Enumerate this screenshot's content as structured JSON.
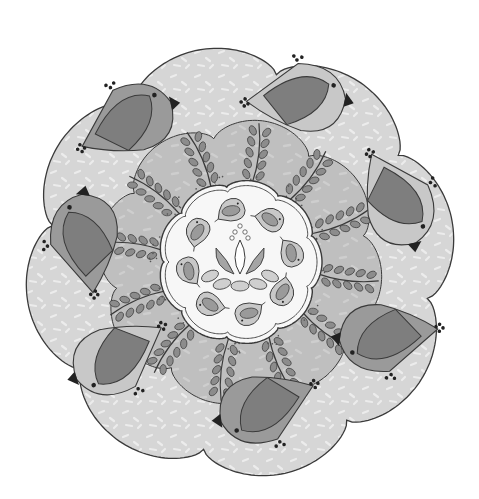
{
  "palette": {
    "background": "#ffffff",
    "outer_ring": "#d6d6d6",
    "outer_ring_speckle": "#ececec",
    "middle_ring": "#bdbdbd",
    "inner_plate": "#f7f7f7",
    "outline": "#3a3a3a",
    "bird_body_dark": "#9a9a9a",
    "bird_body_light": "#c8c8c8",
    "bird_wing": "#7e7e7e",
    "fern": "#8c8c8c",
    "beak": "#222222",
    "lotus_dark": "#a5a5a5",
    "lotus_light": "#cfcfcf"
  },
  "large_birds": [
    {
      "label": "bird-top-left",
      "facing": "right",
      "tone": "dark"
    },
    {
      "label": "bird-top",
      "facing": "right",
      "tone": "light"
    },
    {
      "label": "bird-right-upper",
      "facing": "down",
      "tone": "light"
    },
    {
      "label": "bird-right-lower",
      "facing": "left",
      "tone": "dark"
    },
    {
      "label": "bird-bottom",
      "facing": "left",
      "tone": "dark"
    },
    {
      "label": "bird-bottom-left",
      "facing": "left",
      "tone": "light"
    },
    {
      "label": "bird-left",
      "facing": "up",
      "tone": "dark"
    }
  ],
  "small_bird_count": 8,
  "fern_count": 12,
  "centerpiece": "lotus-flower"
}
